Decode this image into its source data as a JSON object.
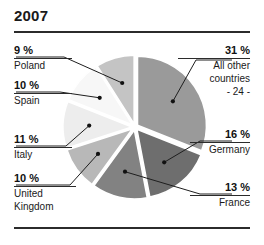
{
  "figure": {
    "title": "2007",
    "title_color": "#1a1a1a",
    "rule_color": "#2b2b2b",
    "background": "#ffffff"
  },
  "chart_data": {
    "type": "pie",
    "title": "2007",
    "xlabel": "",
    "ylabel": "",
    "unit": "%",
    "exploded": true,
    "grid": false,
    "legend": "callout-labels",
    "categories": [
      "All other countries - 24 -",
      "Germany",
      "France",
      "United Kingdom",
      "Italy",
      "Spain",
      "Poland"
    ],
    "values": [
      31,
      16,
      13,
      10,
      11,
      10,
      9
    ],
    "slices": [
      {
        "label": "All other countries",
        "sublabel": "- 24 -",
        "pct_text": "31 %",
        "value": 31,
        "color": "#9a9a9a",
        "side": "right"
      },
      {
        "label": "Germany",
        "sublabel": "",
        "pct_text": "16 %",
        "value": 16,
        "color": "#6e6e6e",
        "side": "right"
      },
      {
        "label": "France",
        "sublabel": "",
        "pct_text": "13 %",
        "value": 13,
        "color": "#828282",
        "side": "right"
      },
      {
        "label": "United Kingdom",
        "sublabel": "",
        "pct_text": "10 %",
        "value": 10,
        "color": "#b8b8b8",
        "side": "left"
      },
      {
        "label": "Italy",
        "sublabel": "",
        "pct_text": "11 %",
        "value": 11,
        "color": "#ededed",
        "side": "left"
      },
      {
        "label": "Spain",
        "sublabel": "",
        "pct_text": "10 %",
        "value": 10,
        "color": "#f7f7f7",
        "side": "left"
      },
      {
        "label": "Poland",
        "sublabel": "",
        "pct_text": "9 %",
        "value": 9,
        "color": "#c4c4c4",
        "side": "left"
      }
    ]
  },
  "callouts": {
    "all_other": {
      "pct": "31 %",
      "line1": "All other",
      "line2": "countries",
      "line3": "- 24 -"
    },
    "germany": {
      "pct": "16 %",
      "name": "Germany"
    },
    "france": {
      "pct": "13 %",
      "name": "France"
    },
    "uk": {
      "pct": "10 %",
      "line1": "United",
      "line2": "Kingdom"
    },
    "italy": {
      "pct": "11 %",
      "name": "Italy"
    },
    "spain": {
      "pct": "10 %",
      "name": "Spain"
    },
    "poland": {
      "pct": "9 %",
      "name": "Poland"
    }
  }
}
